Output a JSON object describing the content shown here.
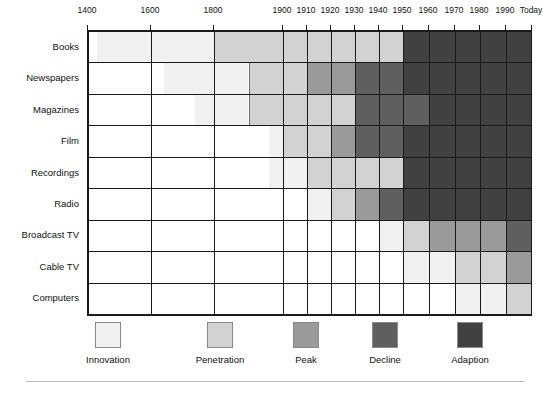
{
  "chart_data": {
    "type": "bar",
    "title": "",
    "subtitle": "",
    "xlabel": "",
    "ylabel": "",
    "orientation": "horizontal",
    "stacked": true,
    "grid": true,
    "legend_position": "bottom",
    "axis": {
      "ticks": [
        {
          "label": "1400",
          "value": 1400
        },
        {
          "label": "1600",
          "value": 1600
        },
        {
          "label": "1800",
          "value": 1800
        },
        {
          "label": "1900",
          "value": 1900
        },
        {
          "label": "1910",
          "value": 1910
        },
        {
          "label": "1920",
          "value": 1920
        },
        {
          "label": "1930",
          "value": 1930
        },
        {
          "label": "1940",
          "value": 1940
        },
        {
          "label": "1950",
          "value": 1950
        },
        {
          "label": "1960",
          "value": 1960
        },
        {
          "label": "1970",
          "value": 1970
        },
        {
          "label": "1980",
          "value": 1980
        },
        {
          "label": "1990",
          "value": 1990
        },
        {
          "label": "Today",
          "value": 2000
        }
      ],
      "xlim": [
        1400,
        2000
      ],
      "scale": "piecewise"
    },
    "phases": [
      {
        "key": "innovation",
        "label": "Innovation",
        "color": "#f1f1f1"
      },
      {
        "key": "penetration",
        "label": "Penetration",
        "color": "#d2d2d2"
      },
      {
        "key": "peak",
        "label": "Peak",
        "color": "#9a9a9a"
      },
      {
        "key": "decline",
        "label": "Decline",
        "color": "#5f5f5f"
      },
      {
        "key": "adaption",
        "label": "Adaption",
        "color": "#414141"
      }
    ],
    "categories": [
      "Books",
      "Newspapers",
      "Magazines",
      "Film",
      "Recordings",
      "Radio",
      "Broadcast TV",
      "Cable TV",
      "Computers"
    ],
    "series": [
      {
        "name": "Books",
        "segments": [
          {
            "phase": "innovation",
            "start": 1430,
            "end": 1800
          },
          {
            "phase": "penetration",
            "start": 1800,
            "end": 1950
          },
          {
            "phase": "adaption",
            "start": 1950,
            "end": 2000
          }
        ]
      },
      {
        "name": "Newspapers",
        "segments": [
          {
            "phase": "innovation",
            "start": 1640,
            "end": 1850
          },
          {
            "phase": "penetration",
            "start": 1850,
            "end": 1910
          },
          {
            "phase": "peak",
            "start": 1910,
            "end": 1930
          },
          {
            "phase": "decline",
            "start": 1930,
            "end": 1950
          },
          {
            "phase": "adaption",
            "start": 1950,
            "end": 2000
          }
        ]
      },
      {
        "name": "Magazines",
        "segments": [
          {
            "phase": "innovation",
            "start": 1740,
            "end": 1850
          },
          {
            "phase": "penetration",
            "start": 1850,
            "end": 1930
          },
          {
            "phase": "decline",
            "start": 1930,
            "end": 1960
          },
          {
            "phase": "adaption",
            "start": 1960,
            "end": 2000
          }
        ]
      },
      {
        "name": "Film",
        "segments": [
          {
            "phase": "innovation",
            "start": 1880,
            "end": 1900
          },
          {
            "phase": "penetration",
            "start": 1900,
            "end": 1920
          },
          {
            "phase": "peak",
            "start": 1920,
            "end": 1930
          },
          {
            "phase": "decline",
            "start": 1930,
            "end": 1950
          },
          {
            "phase": "adaption",
            "start": 1950,
            "end": 2000
          }
        ]
      },
      {
        "name": "Recordings",
        "segments": [
          {
            "phase": "innovation",
            "start": 1880,
            "end": 1910
          },
          {
            "phase": "penetration",
            "start": 1910,
            "end": 1950
          },
          {
            "phase": "adaption",
            "start": 1950,
            "end": 2000
          }
        ]
      },
      {
        "name": "Radio",
        "segments": [
          {
            "phase": "innovation",
            "start": 1910,
            "end": 1920
          },
          {
            "phase": "penetration",
            "start": 1920,
            "end": 1930
          },
          {
            "phase": "peak",
            "start": 1930,
            "end": 1940
          },
          {
            "phase": "decline",
            "start": 1940,
            "end": 1950
          },
          {
            "phase": "adaption",
            "start": 1950,
            "end": 2000
          }
        ]
      },
      {
        "name": "Broadcast TV",
        "segments": [
          {
            "phase": "innovation",
            "start": 1940,
            "end": 1950
          },
          {
            "phase": "penetration",
            "start": 1950,
            "end": 1960
          },
          {
            "phase": "peak",
            "start": 1960,
            "end": 1990
          },
          {
            "phase": "decline",
            "start": 1990,
            "end": 2000
          }
        ]
      },
      {
        "name": "Cable TV",
        "segments": [
          {
            "phase": "innovation",
            "start": 1950,
            "end": 1970
          },
          {
            "phase": "penetration",
            "start": 1970,
            "end": 1990
          },
          {
            "phase": "peak",
            "start": 1990,
            "end": 2000
          }
        ]
      },
      {
        "name": "Computers",
        "segments": [
          {
            "phase": "innovation",
            "start": 1970,
            "end": 1990
          },
          {
            "phase": "penetration",
            "start": 1990,
            "end": 2000
          }
        ]
      }
    ]
  }
}
